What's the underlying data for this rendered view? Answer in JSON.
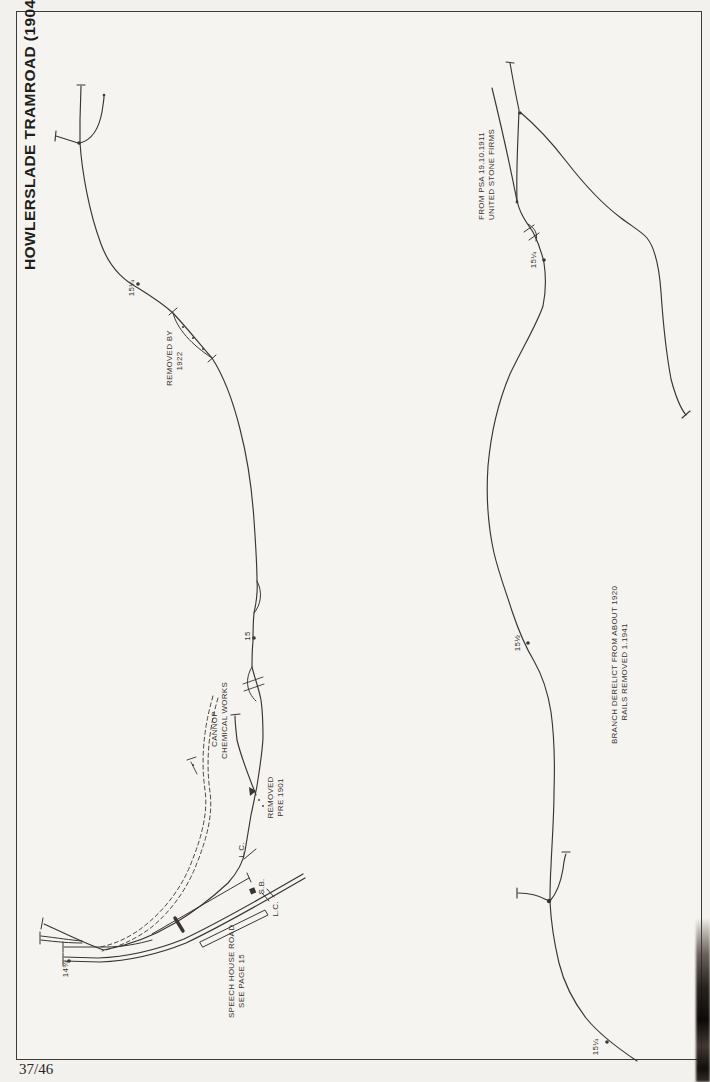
{
  "title": "HOWLERSLADE TRAMROAD (1904)",
  "page_number": "37/46",
  "colors": {
    "ink": "#3a3531",
    "paper": "#f6f4f0",
    "frame_border": "#3f3b36"
  },
  "d1": {
    "mp_15q": "15¼",
    "removed_by": [
      "REMOVED BY",
      "1922"
    ],
    "mp_15": "15",
    "cannop": [
      "CANNOP",
      "CHEMICAL WORKS"
    ],
    "removed_pre": [
      "REMOVED",
      "PRE 1901"
    ],
    "lc_upper": "L.C.",
    "sb": "S.B.",
    "lc_lower": "L.C.",
    "speech_house": [
      "SPEECH HOUSE ROAD",
      "SEE PAGE 15"
    ],
    "mp_14t": "14¾"
  },
  "d2": {
    "psa": [
      "FROM PSA 19.10.1911",
      "UNITED STONE FIRMS"
    ],
    "mp_15q_a": "15¼",
    "mp_15h": "15½",
    "branch_derelict": [
      "BRANCH DERELICT FROM ABOUT 1920",
      "RAILS REMOVED 1.1941"
    ],
    "mp_15q_b": "15¼"
  }
}
